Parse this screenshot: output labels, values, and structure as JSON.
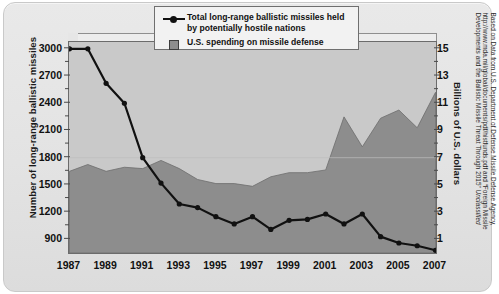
{
  "chart_data": {
    "type": "area",
    "title": "",
    "xlabel": "",
    "ylabel": "Number of long-range ballistic missiles",
    "y2label": "Billions of U.S. dollars",
    "x": [
      1987,
      1988,
      1989,
      1990,
      1991,
      1992,
      1993,
      1994,
      1995,
      1996,
      1997,
      1998,
      1999,
      2000,
      2001,
      2002,
      2003,
      2004,
      2005,
      2006,
      2007
    ],
    "xtick_labels": [
      "1987",
      "1989",
      "1991",
      "1993",
      "1995",
      "1997",
      "1999",
      "2001",
      "2003",
      "2005",
      "2007"
    ],
    "ytick_labels_left": [
      "3000",
      "2700",
      "2400",
      "2100",
      "1800",
      "1500",
      "1200",
      "900"
    ],
    "ytick_labels_right": [
      "15",
      "13",
      "11",
      "9",
      "7",
      "5",
      "3",
      "1"
    ],
    "ylim": [
      750,
      3075
    ],
    "y2lim": [
      0,
      15.5
    ],
    "grid": false,
    "legend_position": "top-right",
    "series": [
      {
        "name": "Total long-range ballistic missiles held by potentially hostile nations",
        "type": "line",
        "axis": "left",
        "color": "#111111",
        "values": [
          3000,
          3000,
          2620,
          2400,
          1800,
          1520,
          1290,
          1250,
          1150,
          1070,
          1150,
          1010,
          1110,
          1120,
          1180,
          1070,
          1180,
          930,
          860,
          830,
          780
        ]
      },
      {
        "name": "U.S. spending on missile defense",
        "type": "area",
        "axis": "right",
        "color": "#8d8d8d",
        "values": [
          6.0,
          6.5,
          6.0,
          6.3,
          6.2,
          6.8,
          6.2,
          5.4,
          5.1,
          5.1,
          4.9,
          5.6,
          5.9,
          5.9,
          6.1,
          10.0,
          7.8,
          9.9,
          10.5,
          9.2,
          11.8
        ]
      }
    ]
  },
  "legend": {
    "items": [
      {
        "marker": "line-marker",
        "line1": "Total long-range ballistic missiles held",
        "line2": "by potentially hostile nations"
      },
      {
        "marker": "filled-square",
        "line1": "U.S. spending on missile defense",
        "line2": ""
      }
    ]
  },
  "source_note": {
    "line1": "Based on Data from U.S. Department of Defense  Missile Defense Agency,",
    "line2": "http://www.mda.mil/global/documents/pdf/histfunds.pdf and “Foreign Missile",
    "line3_a": "Developments and the Ballistic Missile Threat Through 2015” ",
    "line3_b": "Unclassified"
  }
}
